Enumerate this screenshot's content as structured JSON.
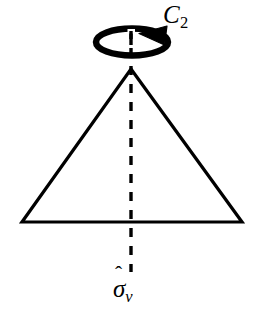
{
  "figure": {
    "background_color": "#ffffff",
    "stroke_color": "#000000",
    "width": 257,
    "height": 317
  },
  "labels": {
    "rotation_axis": {
      "name": "C2 rotation axis operator",
      "base": "C",
      "hat": "ˆ",
      "subscript": "2",
      "plain_text": "Ĉ₂"
    },
    "mirror_plane": {
      "name": "sigma-v mirror plane operator",
      "base": "σ",
      "hat": "ˆ",
      "subscript": "v",
      "plain_text": "σ̂v"
    }
  },
  "shapes": {
    "triangle": {
      "name": "isosceles-triangle",
      "apex": [
        131,
        69
      ],
      "base_left": [
        22,
        222
      ],
      "base_right": [
        242,
        222
      ],
      "stroke_width": 3.2,
      "fill": "none"
    },
    "mirror_line": {
      "name": "dashed-vertical-mirror-line",
      "x": 131,
      "y_top": 30,
      "y_bottom": 272,
      "stroke_width": 3.4,
      "dash_pattern": "9 9"
    },
    "rotation_ellipse": {
      "name": "rotation-arrow-ellipse",
      "center": [
        132,
        42
      ],
      "rx": 36,
      "ry": 13.5,
      "stroke_width": 6.5,
      "fill": "none"
    },
    "arrow_head": {
      "name": "rotation-arrowhead",
      "points": "166,27 140,33 164,44",
      "fill": "#000000"
    }
  }
}
